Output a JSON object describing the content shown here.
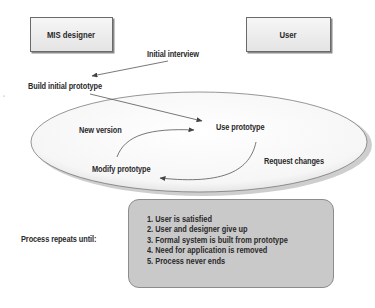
{
  "actors": {
    "designer": "MIS designer",
    "user": "User"
  },
  "flow": {
    "initial_interview": "Initial interview",
    "build_initial_prototype": "Build initial prototype",
    "new_version": "New version",
    "use_prototype": "Use prototype",
    "modify_prototype": "Modify prototype",
    "request_changes": "Request changes"
  },
  "termination": {
    "label": "Process repeats until:",
    "conditions": [
      "1. User is satisfied",
      "2. User and designer give up",
      "3. Formal system is built from prototype",
      "4. Need for application is removed",
      "5. Process never ends"
    ]
  },
  "colors": {
    "box_fill": "#e9e9e9",
    "ellipse_fill": "#f7f7f7",
    "ellipse_shadow": "#bdbdbd",
    "condition_box_fill": "#c9c9c9",
    "text": "#2a2a2a",
    "line": "#555555"
  }
}
